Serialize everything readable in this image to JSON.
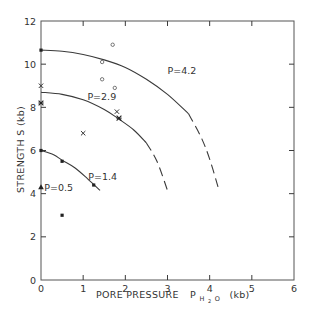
{
  "chart_data": {
    "type": "scatter",
    "title": "",
    "xlabel": "PORE PRESSURE",
    "xlabel_symbol": "P",
    "xlabel_subscript": "H₂O",
    "xlabel_unit": "(kb)",
    "ylabel": "STRENGTH  S  (kb)",
    "xlim": [
      0,
      6
    ],
    "ylim": [
      0,
      12
    ],
    "x_ticks": [
      0,
      1,
      2,
      3,
      4,
      5,
      6
    ],
    "y_ticks": [
      0,
      2,
      4,
      6,
      8,
      10,
      12
    ],
    "x_tick_labels": [
      "0",
      "1",
      "2",
      "3",
      "4",
      "5",
      "6"
    ],
    "y_tick_labels": [
      "0",
      "2",
      "4",
      "6",
      "8",
      "10",
      "12"
    ],
    "grid": false,
    "legend": null,
    "curves": [
      {
        "name": "P=4.2",
        "label": "P=4.2",
        "label_pos": [
          3.0,
          9.7
        ],
        "solid": [
          [
            0,
            10.65
          ],
          [
            0.5,
            10.6
          ],
          [
            1.0,
            10.45
          ],
          [
            1.5,
            10.2
          ],
          [
            2.0,
            9.85
          ],
          [
            2.5,
            9.3
          ],
          [
            3.0,
            8.6
          ],
          [
            3.5,
            7.7
          ]
        ],
        "dashed": [
          [
            3.5,
            7.7
          ],
          [
            3.8,
            6.6
          ],
          [
            4.0,
            5.6
          ],
          [
            4.2,
            4.3
          ]
        ]
      },
      {
        "name": "P=2.9",
        "label": "P=2.9",
        "label_pos": [
          1.1,
          8.5
        ],
        "solid": [
          [
            0,
            8.7
          ],
          [
            0.5,
            8.6
          ],
          [
            1.0,
            8.35
          ],
          [
            1.5,
            7.9
          ],
          [
            1.85,
            7.45
          ],
          [
            2.2,
            6.95
          ],
          [
            2.5,
            6.35
          ]
        ],
        "dashed": [
          [
            2.5,
            6.35
          ],
          [
            2.75,
            5.5
          ],
          [
            3.0,
            4.15
          ]
        ]
      },
      {
        "name": "P=1.4",
        "label": "P=1.4",
        "label_pos": [
          1.12,
          4.8
        ],
        "solid": [
          [
            0,
            6.0
          ],
          [
            0.3,
            5.8
          ],
          [
            0.5,
            5.55
          ],
          [
            0.8,
            5.2
          ],
          [
            1.1,
            4.7
          ],
          [
            1.4,
            4.15
          ]
        ],
        "dashed": []
      }
    ],
    "series": [
      {
        "name": "filled-circle",
        "marker": "filled-circle",
        "points": [
          [
            0,
            10.65
          ],
          [
            0,
            6.0
          ],
          [
            0.5,
            5.5
          ],
          [
            1.25,
            4.4
          ],
          [
            0.5,
            3.0
          ]
        ]
      },
      {
        "name": "open-circle",
        "marker": "open-circle",
        "points": [
          [
            1.7,
            10.9
          ],
          [
            1.45,
            10.1
          ],
          [
            1.45,
            9.3
          ],
          [
            1.75,
            8.9
          ]
        ]
      },
      {
        "name": "cross",
        "marker": "x",
        "points": [
          [
            0,
            9.0
          ],
          [
            1.0,
            6.8
          ],
          [
            1.8,
            7.8
          ]
        ]
      },
      {
        "name": "asterisk",
        "marker": "asterisk",
        "points": [
          [
            0,
            8.2
          ],
          [
            1.85,
            7.5
          ]
        ]
      },
      {
        "name": "triangle",
        "marker": "filled-triangle",
        "label": "P=0.5",
        "points": [
          [
            0,
            4.3
          ]
        ]
      }
    ],
    "annotations": [
      {
        "text": "P=4.2",
        "x": 3.0,
        "y": 9.7
      },
      {
        "text": "P=2.9",
        "x": 1.1,
        "y": 8.5
      },
      {
        "text": "P=1.4",
        "x": 1.12,
        "y": 4.8
      },
      {
        "text": "P=0.5",
        "x": 0.08,
        "y": 4.3
      }
    ]
  },
  "axis_labels": {
    "x_main": "PORE PRESSURE",
    "x_symbol": "P",
    "x_sub": "H",
    "x_sub2": "2",
    "x_sub3": "O",
    "x_unit": "(kb)",
    "y": "STRENGTH  S  (kb)"
  }
}
